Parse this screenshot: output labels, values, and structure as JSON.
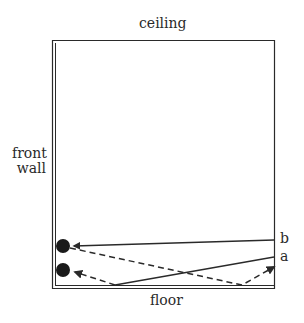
{
  "diagram": {
    "labels": {
      "ceiling": "ceiling",
      "front_wall_line1": "front",
      "front_wall_line2": "wall",
      "floor": "floor",
      "path_b": "b",
      "path_a": "a"
    },
    "elements": {
      "room": "rectangle with double-line front wall and floor",
      "sources": [
        "upper dot (listener/source at front wall)",
        "lower dot (listener/source at front wall)"
      ],
      "paths": [
        {
          "name": "b",
          "style": "solid",
          "description": "direct line from right to upper dot"
        },
        {
          "name": "b-reflection",
          "style": "dashed",
          "description": "from upper dot down to floor, reflecting up to right edge"
        },
        {
          "name": "a",
          "style": "solid",
          "description": "from right down to floor near left"
        },
        {
          "name": "a-reflection",
          "style": "dashed",
          "description": "from floor reflection to lower dot"
        }
      ]
    },
    "colors": {
      "ink": "#2a2a2a",
      "background": "#ffffff"
    }
  }
}
